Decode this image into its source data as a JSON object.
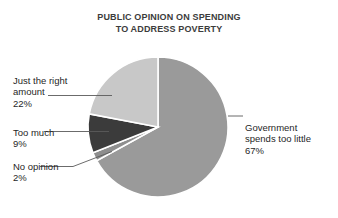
{
  "chart_data": {
    "type": "pie",
    "title": "PUBLIC OPINION ON SPENDING\nTO ADDRESS POVERTY",
    "title_line1": "PUBLIC OPINION ON SPENDING",
    "title_line2": "TO ADDRESS POVERTY",
    "xlabel": "",
    "ylabel": "",
    "legend_position": "callout-labels",
    "grid": false,
    "start_angle_deg": 0,
    "direction": "clockwise",
    "categories": [
      "Government spends too little",
      "No opinion",
      "Too much",
      "Just the right amount"
    ],
    "values": [
      67,
      2,
      9,
      22
    ],
    "value_labels": [
      "67%",
      "2%",
      "9%",
      "22%"
    ],
    "colors": [
      "#9a9a9a",
      "#8e8e8e",
      "#3b3b3b",
      "#c8c8c8"
    ],
    "slice_separator_color": "#ffffff",
    "slices": [
      {
        "name": "Government spends too little",
        "value": 67,
        "value_label": "67%",
        "color": "#9a9a9a",
        "label_line1": "Government",
        "label_line2": "spends too little"
      },
      {
        "name": "No opinion",
        "value": 2,
        "value_label": "2%",
        "color": "#8e8e8e",
        "label_line1": "No opinion",
        "label_line2": ""
      },
      {
        "name": "Too much",
        "value": 9,
        "value_label": "9%",
        "color": "#3b3b3b",
        "label_line1": "Too much",
        "label_line2": ""
      },
      {
        "name": "Just the right amount",
        "value": 22,
        "value_label": "22%",
        "color": "#c8c8c8",
        "label_line1": "Just the right",
        "label_line2": "amount"
      }
    ]
  },
  "callouts": {
    "just_right": {
      "text": "Just the right\namount",
      "percent": "22%"
    },
    "too_much": {
      "text": "Too much",
      "percent": "9%"
    },
    "no_opinion": {
      "text": "No opinion",
      "percent": "2%"
    },
    "too_little": {
      "text": "Government\nspends too little",
      "percent": "67%"
    }
  },
  "style": {
    "background": "#ffffff",
    "title_color": "#3c3c3c",
    "label_color": "#1f1f1f",
    "leader_line_color": "#5a5a5a"
  }
}
